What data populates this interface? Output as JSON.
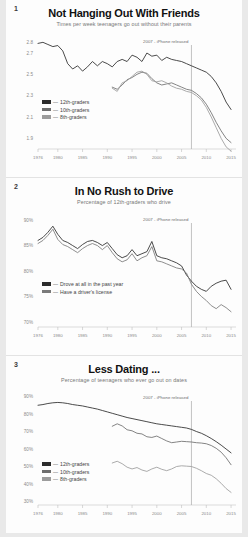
{
  "page": {
    "background": "#e9e9e9",
    "card_background": "#fdfdfd"
  },
  "colors": {
    "line_12th": "#2b2b2b",
    "line_10th": "#6e6e6e",
    "line_8th": "#9c9c9c",
    "line_drove": "#2b2b2b",
    "line_license": "#7a7a7a",
    "marker_line": "#a9a9a9",
    "tick_text": "#8a8a8a",
    "title_text": "#111111",
    "subtitle_text": "#777777"
  },
  "charts": [
    {
      "number": "1",
      "title": "Not Hanging Out With Friends",
      "subtitle": "Times per week teenagers go out without their parents",
      "annotation": "2007 - iPhone released",
      "legend": [
        {
          "label": "12th-graders",
          "color": "#2b2b2b",
          "dash": "—"
        },
        {
          "label": "10th-graders",
          "color": "#6e6e6e",
          "dash": "—"
        },
        {
          "label": "8th-graders",
          "color": "#9c9c9c",
          "dash": "—"
        }
      ],
      "chart_data": {
        "type": "line",
        "title": "Not Hanging Out With Friends",
        "subtitle": "Times per week teenagers go out without their parents",
        "xlabel": "",
        "ylabel": "Times per week",
        "xlim": [
          1976,
          2016
        ],
        "ylim": [
          1.8,
          2.85
        ],
        "yticks": [
          "2.8",
          "2.7",
          "2.5",
          "2.3",
          "2.1",
          "1.9"
        ],
        "ytick_values": [
          2.8,
          2.7,
          2.5,
          2.3,
          2.1,
          1.9
        ],
        "xticks": [
          "1976",
          "1980",
          "1985",
          "1990",
          "1995",
          "2000",
          "2005",
          "2010",
          "2015"
        ],
        "xtick_values": [
          1976,
          1980,
          1985,
          1990,
          1995,
          2000,
          2005,
          2010,
          2015
        ],
        "grid": false,
        "legend_position": "lower-left",
        "annotations": [
          {
            "text": "2007 - iPhone released",
            "x": 2007,
            "type": "vline"
          }
        ],
        "series": [
          {
            "name": "12th-graders",
            "color": "#2b2b2b",
            "x": [
              1976,
              1977,
              1978,
              1979,
              1980,
              1981,
              1982,
              1983,
              1984,
              1985,
              1986,
              1987,
              1988,
              1989,
              1990,
              1991,
              1992,
              1993,
              1994,
              1995,
              1996,
              1997,
              1998,
              1999,
              2000,
              2001,
              2002,
              2003,
              2004,
              2005,
              2006,
              2007,
              2008,
              2009,
              2010,
              2011,
              2012,
              2013,
              2014,
              2015
            ],
            "values": [
              2.79,
              2.8,
              2.78,
              2.76,
              2.77,
              2.72,
              2.6,
              2.55,
              2.58,
              2.53,
              2.57,
              2.62,
              2.58,
              2.62,
              2.6,
              2.57,
              2.62,
              2.64,
              2.62,
              2.68,
              2.66,
              2.62,
              2.7,
              2.67,
              2.68,
              2.63,
              2.66,
              2.64,
              2.63,
              2.62,
              2.6,
              2.58,
              2.56,
              2.54,
              2.52,
              2.48,
              2.42,
              2.34,
              2.24,
              2.17
            ]
          },
          {
            "name": "10th-graders",
            "color": "#6e6e6e",
            "x": [
              1991,
              1992,
              1993,
              1994,
              1995,
              1996,
              1997,
              1998,
              1999,
              2000,
              2001,
              2002,
              2003,
              2004,
              2005,
              2006,
              2007,
              2008,
              2009,
              2010,
              2011,
              2012,
              2013,
              2014,
              2015
            ],
            "values": [
              2.38,
              2.36,
              2.4,
              2.45,
              2.47,
              2.5,
              2.52,
              2.51,
              2.46,
              2.42,
              2.4,
              2.41,
              2.42,
              2.4,
              2.38,
              2.36,
              2.35,
              2.32,
              2.28,
              2.22,
              2.14,
              2.05,
              1.97,
              1.9,
              1.86
            ]
          },
          {
            "name": "8th-graders",
            "color": "#9c9c9c",
            "x": [
              1991,
              1992,
              1993,
              1994,
              1995,
              1996,
              1997,
              1998,
              1999,
              2000,
              2001,
              2002,
              2003,
              2004,
              2005,
              2006,
              2007,
              2008,
              2009,
              2010,
              2011,
              2012,
              2013,
              2014,
              2015
            ],
            "values": [
              2.37,
              2.34,
              2.42,
              2.44,
              2.48,
              2.52,
              2.53,
              2.5,
              2.44,
              2.43,
              2.44,
              2.42,
              2.39,
              2.37,
              2.36,
              2.34,
              2.33,
              2.3,
              2.26,
              2.19,
              2.1,
              2.0,
              1.9,
              1.82,
              1.78
            ]
          }
        ]
      }
    },
    {
      "number": "2",
      "title": "In No Rush to Drive",
      "subtitle": "Percentage of 12th-graders who drive",
      "annotation": "2007 - iPhone released",
      "legend": [
        {
          "label": "Drove at all in the past year",
          "color": "#2b2b2b",
          "dash": "—"
        },
        {
          "label": "Have a driver's license",
          "color": "#7a7a7a",
          "dash": "—"
        }
      ],
      "chart_data": {
        "type": "line",
        "title": "In No Rush to Drive",
        "subtitle": "Percentage of 12th-graders who drive",
        "xlabel": "",
        "ylabel": "Percentage",
        "xlim": [
          1976,
          2016
        ],
        "ylim": [
          69,
          91
        ],
        "yticks": [
          "90%",
          "85%",
          "80%",
          "75%",
          "70%"
        ],
        "ytick_values": [
          90,
          85,
          80,
          75,
          70
        ],
        "xticks": [
          "1976",
          "1980",
          "1985",
          "1990",
          "1995",
          "2000",
          "2005",
          "2010",
          "2015"
        ],
        "xtick_values": [
          1976,
          1980,
          1985,
          1990,
          1995,
          2000,
          2005,
          2010,
          2015
        ],
        "grid": false,
        "legend_position": "lower-left",
        "annotations": [
          {
            "text": "2007 - iPhone released",
            "x": 2007,
            "type": "vline"
          }
        ],
        "series": [
          {
            "name": "Drove at all in the past year",
            "color": "#2b2b2b",
            "x": [
              1976,
              1977,
              1978,
              1979,
              1980,
              1981,
              1982,
              1983,
              1984,
              1985,
              1986,
              1987,
              1988,
              1989,
              1990,
              1991,
              1992,
              1993,
              1994,
              1995,
              1996,
              1997,
              1998,
              1999,
              2000,
              2001,
              2002,
              2003,
              2004,
              2005,
              2006,
              2007,
              2008,
              2009,
              2010,
              2011,
              2012,
              2013,
              2014,
              2015
            ],
            "values": [
              86.0,
              86.6,
              87.6,
              88.8,
              87.2,
              86.0,
              85.6,
              85.0,
              84.4,
              85.2,
              85.8,
              86.0,
              85.6,
              85.0,
              85.6,
              84.4,
              83.2,
              82.6,
              83.0,
              84.2,
              83.0,
              83.4,
              83.8,
              85.8,
              83.0,
              82.6,
              82.4,
              82.0,
              81.6,
              81.0,
              79.2,
              78.0,
              77.0,
              76.4,
              76.0,
              77.0,
              77.6,
              78.0,
              78.2,
              76.4
            ]
          },
          {
            "name": "Have a driver's license",
            "color": "#7a7a7a",
            "x": [
              1976,
              1977,
              1978,
              1979,
              1980,
              1981,
              1982,
              1983,
              1984,
              1985,
              1986,
              1987,
              1988,
              1989,
              1990,
              1991,
              1992,
              1993,
              1994,
              1995,
              1996,
              1997,
              1998,
              1999,
              2000,
              2001,
              2002,
              2003,
              2004,
              2005,
              2006,
              2007,
              2008,
              2009,
              2010,
              2011,
              2012,
              2013,
              2014,
              2015
            ],
            "values": [
              85.4,
              86.0,
              87.0,
              88.2,
              86.2,
              85.2,
              84.8,
              84.2,
              83.6,
              84.4,
              85.0,
              85.4,
              85.0,
              84.2,
              85.0,
              83.6,
              82.4,
              81.8,
              82.2,
              83.4,
              82.0,
              82.6,
              83.0,
              84.8,
              82.0,
              81.8,
              81.4,
              81.0,
              80.6,
              80.4,
              79.6,
              77.4,
              76.0,
              75.0,
              74.2,
              73.2,
              72.6,
              73.4,
              72.8,
              72.0
            ]
          }
        ]
      }
    },
    {
      "number": "3",
      "title": "Less Dating ...",
      "subtitle": "Percentage of teenagers who ever go out on dates",
      "annotation": "2007 - iPhone released",
      "legend": [
        {
          "label": "12th-graders",
          "color": "#2b2b2b",
          "dash": "—"
        },
        {
          "label": "10th-graders",
          "color": "#6e6e6e",
          "dash": "—"
        },
        {
          "label": "8th-graders",
          "color": "#9c9c9c",
          "dash": "—"
        }
      ],
      "chart_data": {
        "type": "line",
        "title": "Less Dating ...",
        "subtitle": "Percentage of teenagers who ever go out on dates",
        "xlabel": "",
        "ylabel": "Percentage",
        "xlim": [
          1976,
          2016
        ],
        "ylim": [
          28,
          92
        ],
        "yticks": [
          "90%",
          "80%",
          "70%",
          "60%",
          "50%",
          "40%",
          "30%"
        ],
        "ytick_values": [
          90,
          80,
          70,
          60,
          50,
          40,
          30
        ],
        "xticks": [
          "1976",
          "1980",
          "1985",
          "1990",
          "1995",
          "2000",
          "2005",
          "2010",
          "2015"
        ],
        "xtick_values": [
          1976,
          1980,
          1985,
          1990,
          1995,
          2000,
          2005,
          2010,
          2015
        ],
        "grid": false,
        "legend_position": "lower-left",
        "annotations": [
          {
            "text": "2007 - iPhone released",
            "x": 2007,
            "type": "vline"
          }
        ],
        "series": [
          {
            "name": "12th-graders",
            "color": "#2b2b2b",
            "x": [
              1976,
              1977,
              1978,
              1979,
              1980,
              1981,
              1982,
              1983,
              1984,
              1985,
              1986,
              1987,
              1988,
              1989,
              1990,
              1991,
              1992,
              1993,
              1994,
              1995,
              1996,
              1997,
              1998,
              1999,
              2000,
              2001,
              2002,
              2003,
              2004,
              2005,
              2006,
              2007,
              2008,
              2009,
              2010,
              2011,
              2012,
              2013,
              2014,
              2015
            ],
            "values": [
              85.0,
              85.4,
              86.0,
              86.4,
              86.6,
              86.4,
              86.0,
              85.4,
              85.0,
              84.6,
              84.0,
              83.4,
              82.8,
              82.0,
              81.2,
              80.4,
              79.6,
              78.8,
              78.0,
              77.4,
              76.8,
              76.2,
              75.6,
              75.0,
              74.4,
              74.0,
              73.6,
              73.2,
              72.8,
              72.4,
              72.0,
              71.2,
              70.0,
              69.0,
              67.6,
              66.0,
              64.2,
              62.2,
              60.0,
              57.8
            ]
          },
          {
            "name": "10th-graders",
            "color": "#6e6e6e",
            "x": [
              1991,
              1992,
              1993,
              1994,
              1995,
              1996,
              1997,
              1998,
              1999,
              2000,
              2001,
              2002,
              2003,
              2004,
              2005,
              2006,
              2007,
              2008,
              2009,
              2010,
              2011,
              2012,
              2013,
              2014,
              2015
            ],
            "values": [
              73.0,
              74.4,
              73.2,
              71.0,
              70.4,
              69.0,
              68.6,
              67.0,
              66.6,
              67.4,
              66.0,
              64.6,
              63.6,
              64.0,
              64.4,
              64.2,
              64.0,
              63.6,
              63.4,
              63.0,
              62.0,
              60.4,
              58.2,
              55.0,
              51.0
            ]
          },
          {
            "name": "8th-graders",
            "color": "#9c9c9c",
            "x": [
              1991,
              1992,
              1993,
              1994,
              1995,
              1996,
              1997,
              1998,
              1999,
              2000,
              2001,
              2002,
              2003,
              2004,
              2005,
              2006,
              2007,
              2008,
              2009,
              2010,
              2011,
              2012,
              2013,
              2014,
              2015
            ],
            "values": [
              52.0,
              53.0,
              51.6,
              49.6,
              48.6,
              49.4,
              48.0,
              47.2,
              48.6,
              49.6,
              48.4,
              47.6,
              48.6,
              50.0,
              50.4,
              50.2,
              50.0,
              49.0,
              47.6,
              46.0,
              45.0,
              43.0,
              40.4,
              37.4,
              35.2
            ]
          }
        ]
      }
    }
  ]
}
